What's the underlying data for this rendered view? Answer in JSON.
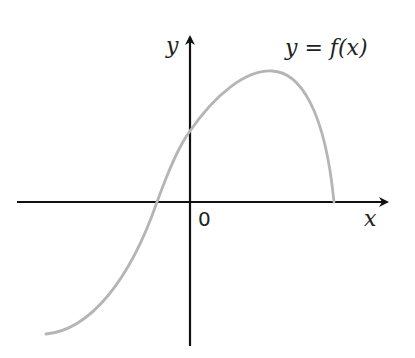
{
  "diagram": {
    "x_axis_label": "x",
    "y_axis_label": "y",
    "origin_label": "0",
    "curve_label": "y = f(x)",
    "colors": {
      "axes": "#111111",
      "curve": "#b5b5b5",
      "text": "#222222"
    }
  }
}
